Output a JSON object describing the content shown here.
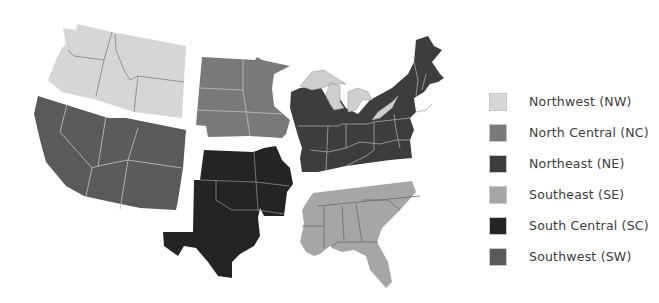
{
  "map": {
    "title": "US Regions",
    "regions": [
      {
        "id": "NW",
        "name": "Northwest (NW)",
        "color": "#d6d6d6",
        "border": "#808080",
        "states": [
          "Washington",
          "Oregon",
          "Idaho",
          "Montana",
          "Wyoming"
        ]
      },
      {
        "id": "NC",
        "name": "North Central (NC)",
        "color": "#797979",
        "border": "#c0c0c0",
        "states": [
          "North Dakota",
          "South Dakota",
          "Nebraska",
          "Minnesota",
          "Iowa"
        ]
      },
      {
        "id": "NE",
        "name": "Northeast (NE)",
        "color": "#3d3d3d",
        "border": "#a8a8a8",
        "states": [
          "Wisconsin",
          "Michigan",
          "Illinois",
          "Indiana",
          "Ohio",
          "Kentucky",
          "West Virginia",
          "Pennsylvania",
          "New York",
          "Vermont",
          "New Hampshire",
          "Maine",
          "Massachusetts",
          "Connecticut",
          "Rhode Island",
          "New Jersey",
          "Delaware",
          "Maryland",
          "Virginia"
        ]
      },
      {
        "id": "SE",
        "name": "Southeast (SE)",
        "color": "#a6a6a6",
        "border": "#6a6a6a",
        "states": [
          "Louisiana",
          "Mississippi",
          "Alabama",
          "Georgia",
          "Florida",
          "South Carolina",
          "North Carolina",
          "Tennessee"
        ]
      },
      {
        "id": "SC",
        "name": "South Central (SC)",
        "color": "#242424",
        "border": "#8a8a8a",
        "states": [
          "Kansas",
          "Missouri",
          "Oklahoma",
          "Arkansas",
          "Texas"
        ]
      },
      {
        "id": "SW",
        "name": "Southwest (SW)",
        "color": "#5a5a5a",
        "border": "#c4c4c4",
        "states": [
          "California",
          "Nevada",
          "Utah",
          "Colorado",
          "Arizona",
          "New Mexico"
        ]
      }
    ],
    "lakes_color": "#cfcfcf"
  },
  "legend": {
    "items": [
      {
        "label": "Northwest (NW)",
        "color": "#d6d6d6"
      },
      {
        "label": "North Central (NC)",
        "color": "#797979"
      },
      {
        "label": "Northeast (NE)",
        "color": "#3d3d3d"
      },
      {
        "label": "Southeast (SE)",
        "color": "#a6a6a6"
      },
      {
        "label": "South Central (SC)",
        "color": "#242424"
      },
      {
        "label": "Southwest (SW)",
        "color": "#5a5a5a"
      }
    ]
  }
}
